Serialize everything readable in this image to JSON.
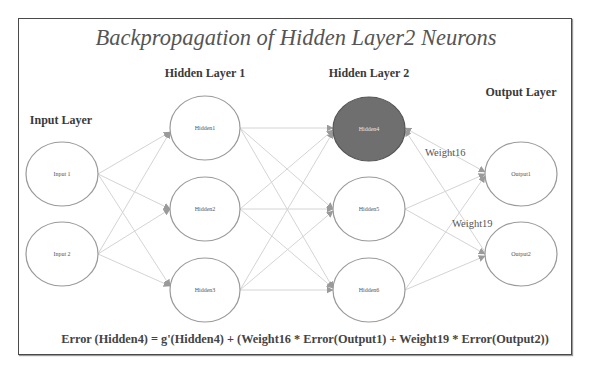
{
  "title": "Backpropagation of Hidden Layer2 Neurons",
  "layers": {
    "input": "Input Layer",
    "hidden1": "Hidden Layer 1",
    "hidden2": "Hidden Layer 2",
    "output": "Output Layer"
  },
  "nodes": {
    "input1": "Input 1",
    "input2": "Input 2",
    "hidden1": "Hidden1",
    "hidden2": "Hidden2",
    "hidden3": "Hidden3",
    "hidden4": "Hidden4",
    "hidden5": "Hidden5",
    "hidden6": "Hidden6",
    "output1": "Output1",
    "output2": "Output2"
  },
  "highlighted_node": "hidden4",
  "weights": {
    "w16": "Weight16",
    "w19": "Weight19"
  },
  "formula": "Error (Hidden4) = g'(Hidden4) + (Weight16 * Error(Output1) + Weight19 * Error(Output2))",
  "colors": {
    "highlight_fill": "#6f6f6f",
    "edge": "#d4d4d4",
    "arrowhead": "#9a9a9a",
    "title": "#555555"
  }
}
